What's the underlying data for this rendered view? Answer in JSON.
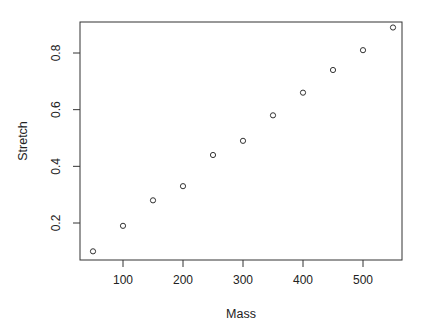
{
  "chart_data": {
    "type": "scatter",
    "title": "",
    "xlabel": "Mass",
    "ylabel": "Stretch",
    "x": [
      50,
      100,
      150,
      200,
      250,
      300,
      350,
      400,
      450,
      500,
      550
    ],
    "y": [
      0.1,
      0.19,
      0.28,
      0.33,
      0.44,
      0.49,
      0.58,
      0.66,
      0.74,
      0.81,
      0.89
    ],
    "xlim": [
      30,
      570
    ],
    "ylim": [
      0.07,
      0.91
    ],
    "xticks": [
      100,
      200,
      300,
      400,
      500
    ],
    "yticks": [
      0.2,
      0.4,
      0.6,
      0.8
    ],
    "xtick_labels": [
      "100",
      "200",
      "300",
      "400",
      "500"
    ],
    "ytick_labels": [
      "0.2",
      "0.4",
      "0.6",
      "0.8"
    ],
    "grid": false,
    "legend": null,
    "marker": "open-circle"
  },
  "colors": {
    "axis": "#333333",
    "marker": "#333333",
    "text": "#222222",
    "background": "#ffffff"
  }
}
